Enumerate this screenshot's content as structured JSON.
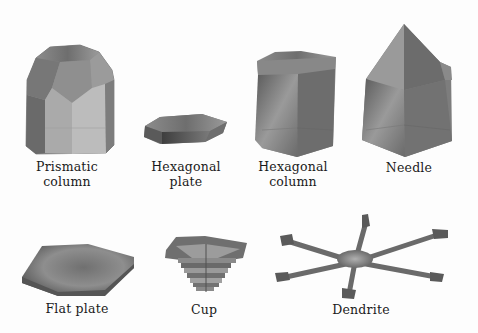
{
  "figure": {
    "crystals": [
      {
        "id": "prismatic-column",
        "label_line1": "Prismatic",
        "label_line2": "column"
      },
      {
        "id": "hexagonal-plate",
        "label_line1": "Hexagonal",
        "label_line2": "plate"
      },
      {
        "id": "hexagonal-column",
        "label_line1": "Hexagonal",
        "label_line2": "column"
      },
      {
        "id": "needle",
        "label_line1": "Needle",
        "label_line2": ""
      },
      {
        "id": "flat-plate",
        "label_line1": "Flat plate",
        "label_line2": ""
      },
      {
        "id": "cup",
        "label_line1": "Cup",
        "label_line2": ""
      },
      {
        "id": "dendrite",
        "label_line1": "Dendrite",
        "label_line2": ""
      }
    ],
    "colors": {
      "background": "#fdfdfd",
      "crystal_light": "#b8b8b8",
      "crystal_mid": "#8a8a8a",
      "crystal_dark": "#4a4a4a",
      "text": "#1a1a1a"
    }
  }
}
